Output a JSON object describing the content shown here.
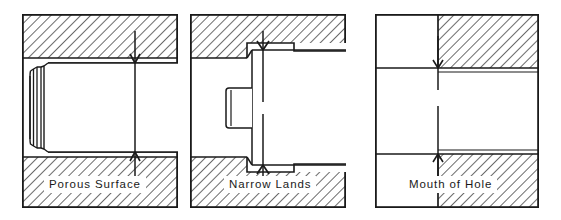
{
  "figure": {
    "background": "#ffffff",
    "line_color": "#1a1a1a",
    "hatch_color": "#3a3a3a",
    "panel_count": 3
  },
  "panels": [
    {
      "id": "panel-1",
      "caption": "Porous Surface",
      "icon": "tube-in-bore-section",
      "geometry": {
        "frame": {
          "x": 0,
          "y": 0,
          "w": 156,
          "h": 194
        },
        "upper_hatch_band": {
          "x": 0,
          "y": 0,
          "w": 156,
          "h": 44
        },
        "lower_hatch_band": {
          "x": 0,
          "y": 143,
          "w": 156,
          "h": 51
        },
        "bore_band": {
          "y_top": 44,
          "y_bottom": 143
        },
        "tube_left_lip_x": 8,
        "tube_body_left_x": 26,
        "centerline_x": 113
      }
    },
    {
      "id": "panel-2",
      "caption": "Narrow Lands",
      "icon": "stepped-tool-in-bore-section",
      "geometry": {
        "frame": {
          "x": 0,
          "y": 0,
          "w": 156,
          "h": 194
        },
        "upper_hatch_band": {
          "x": 0,
          "y": 0,
          "w": 156,
          "h": 44
        },
        "lower_hatch_band": {
          "x": 0,
          "y": 143,
          "w": 156,
          "h": 51
        },
        "shoulder_x": 55,
        "body_left_x": 57,
        "tang_left_x": 36,
        "centerline_x": 73
      }
    },
    {
      "id": "panel-3",
      "caption": "Mouth of Hole",
      "icon": "hole-mouth-section",
      "geometry": {
        "frame": {
          "x": 0,
          "y": 0,
          "w": 164,
          "h": 194
        },
        "hatch_divider_x": 63,
        "upper_band_bottom": 54,
        "lower_band_top": 140,
        "centerline_x": 63
      }
    }
  ],
  "annotations": {
    "centerline_style": "dash-dot vertical axis with inward arrowheads",
    "arrowhead_count": 2,
    "hatch_angle_deg": 45
  }
}
